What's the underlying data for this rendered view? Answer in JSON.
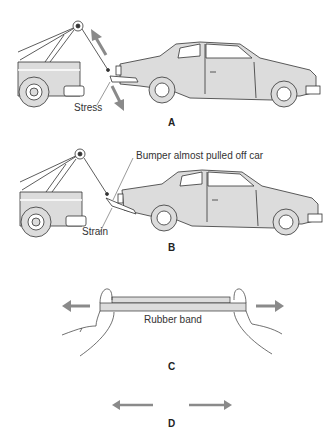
{
  "panels": [
    {
      "id": "A",
      "letter": "A",
      "annotations": {
        "stress": "Stress"
      }
    },
    {
      "id": "B",
      "letter": "B",
      "annotations": {
        "strain": "Strain",
        "bumper": "Bumper almost pulled off car"
      }
    },
    {
      "id": "C",
      "letter": "C",
      "annotations": {
        "rubber_band": "Rubber band"
      }
    },
    {
      "id": "D",
      "letter": "D"
    }
  ],
  "colors": {
    "line": "#333333",
    "fill": "#dcdcdc",
    "arrow": "#8a8a8a"
  },
  "icons": {
    "force_arrow": "arrow-icon",
    "tow_truck": "tow-truck-icon",
    "car": "car-icon",
    "hands": "hand-icon"
  }
}
